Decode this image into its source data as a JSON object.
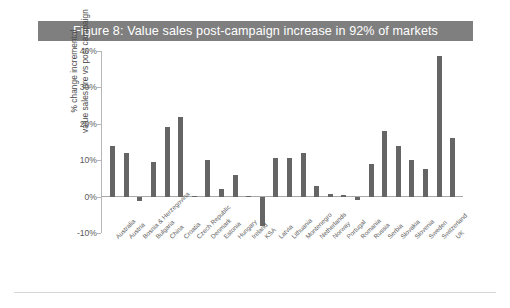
{
  "figure": {
    "title": "Figure 8: Value sales post-campaign increase in 92% of markets",
    "title_bg": "#7f7f7f",
    "title_color": "#ffffff",
    "bar_color": "#656565"
  },
  "chart_data": {
    "type": "bar",
    "title": "Figure 8: Value sales post-campaign increase in 92% of markets",
    "xlabel": "",
    "ylabel": "% change incremental value sales pre vs post campaign",
    "ylabel_line1": "% change incremental",
    "ylabel_line2": "value sales pre vs post campaign",
    "ylim": [
      -10,
      40
    ],
    "ytick_labels": [
      "40%",
      "30%",
      "20%",
      "10%",
      "0%",
      "-10%"
    ],
    "ytick_values": [
      40,
      30,
      20,
      10,
      0,
      -10
    ],
    "grid": false,
    "legend": "none",
    "categories": [
      "Australia",
      "Austria",
      "Bosnia & Herzegovina",
      "Bulgaria",
      "China",
      "Croatia",
      "Czech Republic",
      "Denmark",
      "Estonia",
      "Hungary",
      "Ireland",
      "KSA",
      "Latvia",
      "Lithuania",
      "Montenegro",
      "Netherlands",
      "Norway",
      "Portugal",
      "Romania",
      "Russia",
      "Serbia",
      "Slovakia",
      "Slovenia",
      "Sweden",
      "Switzerland",
      "UK"
    ],
    "values": [
      14.0,
      12.0,
      -1.2,
      9.5,
      19.0,
      22.0,
      0.3,
      10.0,
      2.0,
      6.0,
      0.2,
      -8.0,
      10.5,
      10.5,
      12.0,
      3.0,
      0.8,
      0.5,
      -1.0,
      9.0,
      18.0,
      14.0,
      10.0,
      7.5,
      38.5,
      16.0
    ]
  }
}
